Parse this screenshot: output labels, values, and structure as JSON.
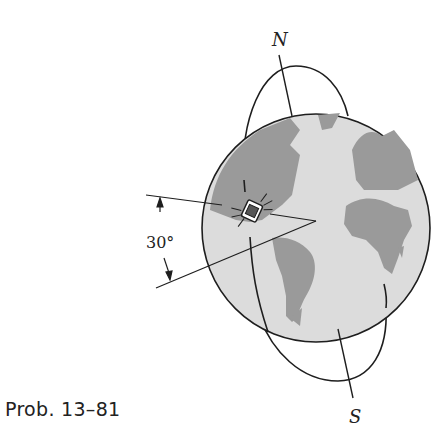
{
  "figure": {
    "caption": "Prob. 13–81",
    "labels": {
      "north": "N",
      "south": "S",
      "angle": "30°"
    },
    "elements": [
      "earth-globe",
      "elliptical-orbit",
      "polar-axis",
      "satellite",
      "angle-lines"
    ],
    "colors": {
      "ocean": "#dcdcdc",
      "land": "#9a9a9a",
      "line": "#1e1e1e"
    }
  }
}
